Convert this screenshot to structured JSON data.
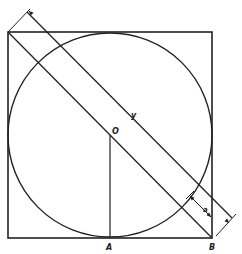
{
  "diagram": {
    "type": "geometry",
    "labels": {
      "center": "O",
      "bottom_tangent": "A",
      "corner": "B",
      "length": "y",
      "width": "a"
    },
    "colors": {
      "stroke": "#222222",
      "background": "#ffffff"
    }
  }
}
